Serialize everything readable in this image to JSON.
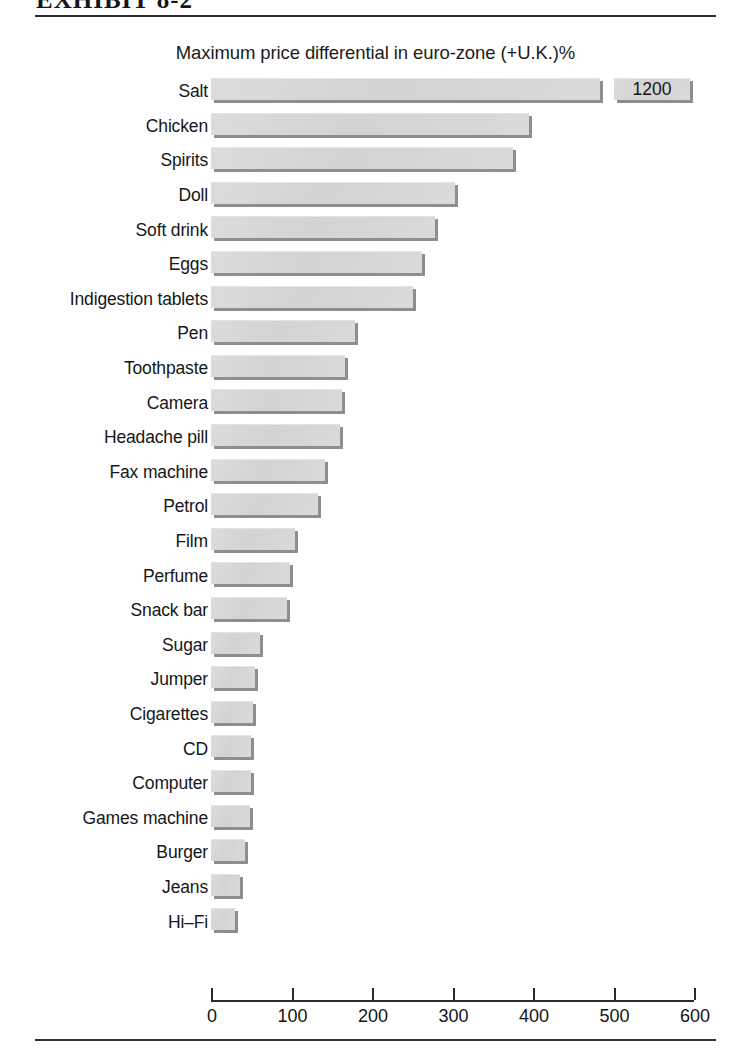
{
  "exhibit": {
    "caption": "EXHIBIT 8-2"
  },
  "chart_title": "Maximum price differential in euro-zone (+U.K.)%",
  "axis": {
    "ticks": [
      0,
      100,
      200,
      300,
      400,
      500,
      600
    ],
    "tick_labels": [
      "0",
      "100",
      "200",
      "300",
      "400",
      "500",
      "600"
    ]
  },
  "break_marker": {
    "label": "1200",
    "applies_to": "Salt"
  },
  "colors": {
    "bar_fill": "#d7d7d7",
    "bar_shadow": "#8e8e8e",
    "text": "#141414",
    "rule": "#2b2b2b"
  },
  "chart_data": {
    "type": "bar",
    "orientation": "horizontal",
    "title": "Maximum price differential in euro-zone (+U.K.)%",
    "xlabel": "",
    "ylabel": "",
    "xlim": [
      0,
      600
    ],
    "grid": false,
    "legend": null,
    "note": "Salt bar is broken: its true value of 1200 exceeds the 600 axis maximum and is annotated in a detached segment.",
    "categories": [
      "Salt",
      "Chicken",
      "Spirits",
      "Doll",
      "Soft drink",
      "Eggs",
      "Indigestion tablets",
      "Pen",
      "Toothpaste",
      "Camera",
      "Headache pill",
      "Fax machine",
      "Petrol",
      "Film",
      "Perfume",
      "Snack bar",
      "Sugar",
      "Jumper",
      "Cigarettes",
      "CD",
      "Computer",
      "Games machine",
      "Burger",
      "Jeans",
      "Hi–Fi"
    ],
    "values": [
      1200,
      395,
      375,
      303,
      278,
      262,
      251,
      179,
      166,
      163,
      160,
      142,
      133,
      104,
      98,
      94,
      61,
      55,
      52,
      50,
      50,
      48,
      42,
      36,
      30
    ],
    "data_labels": [
      "1200",
      "",
      "",
      "",
      "",
      "",
      "",
      "",
      "",
      "",
      "",
      "",
      "",
      "",
      "",
      "",
      "",
      "",
      "",
      "",
      "",
      "",
      "",
      "",
      ""
    ]
  }
}
